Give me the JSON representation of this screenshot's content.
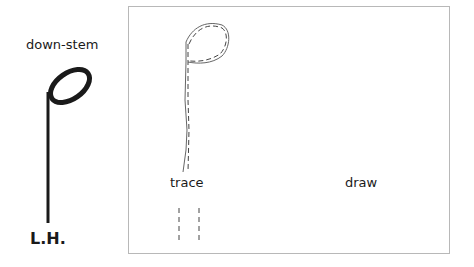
{
  "example": {
    "title": "down-stem",
    "hand": "L.H.",
    "note_type": "half-note-down-stem"
  },
  "practice": {
    "trace_label": "trace",
    "draw_label": "draw"
  },
  "colors": {
    "ink": "#1a1a1a",
    "box_border": "#b8b8b8",
    "trace_line": "#555555"
  }
}
